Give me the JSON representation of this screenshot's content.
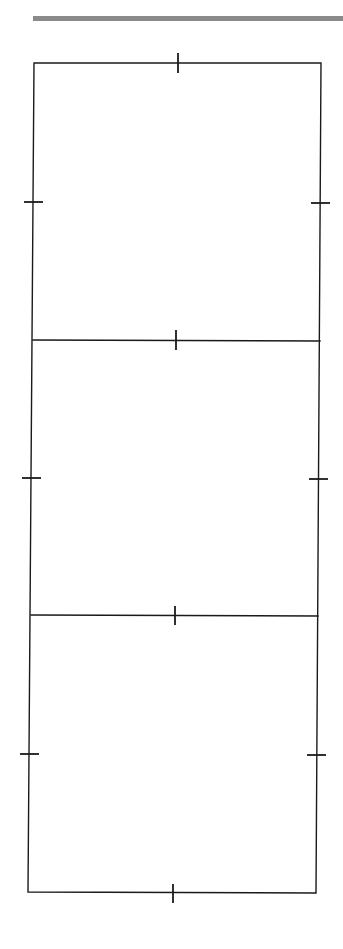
{
  "diagram": {
    "type": "panel-template",
    "panel_count": 3,
    "panels": [
      {
        "id": "panel-1",
        "label": ""
      },
      {
        "id": "panel-2",
        "label": ""
      },
      {
        "id": "panel-3",
        "label": ""
      }
    ],
    "colors": {
      "line": "#1a1a1a",
      "header_rule": "#8a8a8a",
      "background": "#ffffff"
    }
  }
}
